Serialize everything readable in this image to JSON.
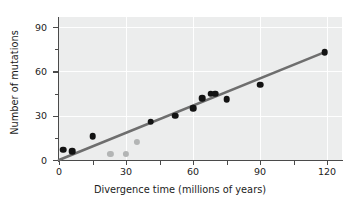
{
  "chart_data": {
    "type": "scatter",
    "title": "",
    "xlabel": "Divergence time (millions of years)",
    "ylabel": "Number of mutations",
    "xlim": [
      0,
      125
    ],
    "ylim": [
      0,
      97
    ],
    "xticks": [
      0,
      30,
      60,
      90,
      120
    ],
    "yticks": [
      0,
      30,
      60,
      90
    ],
    "x_minor_ticks": [
      15,
      45,
      75,
      105
    ],
    "y_minor_ticks": [
      15,
      45,
      75
    ],
    "grid": true,
    "grid_color": "#ffffff",
    "panel_background": "#eceded",
    "legend": null,
    "series": [
      {
        "name": "primate comparisons",
        "marker": "filled-circle",
        "color": "#131313",
        "points": [
          {
            "x": 2,
            "y": 7
          },
          {
            "x": 6,
            "y": 6
          },
          {
            "x": 15,
            "y": 16
          },
          {
            "x": 41,
            "y": 26
          },
          {
            "x": 52,
            "y": 30
          },
          {
            "x": 60,
            "y": 35
          },
          {
            "x": 64,
            "y": 42
          },
          {
            "x": 68,
            "y": 45
          },
          {
            "x": 70,
            "y": 45
          },
          {
            "x": 75,
            "y": 41
          },
          {
            "x": 90,
            "y": 51
          },
          {
            "x": 119,
            "y": 73
          }
        ]
      },
      {
        "name": "outlier comparisons",
        "marker": "filled-circle",
        "color": "#b3b5b5",
        "points": [
          {
            "x": 23,
            "y": 4
          },
          {
            "x": 30,
            "y": 4
          },
          {
            "x": 35,
            "y": 12
          }
        ]
      }
    ],
    "trendline": {
      "name": "regression line",
      "color": "#6e6e6e",
      "width": 2.6,
      "x_start": 0,
      "y_start": 0,
      "x_end": 119,
      "y_end": 73,
      "slope": 0.613,
      "intercept": 0
    }
  },
  "axis": {
    "y_tick_labels": [
      "90",
      "60",
      "30",
      "0"
    ],
    "x_tick_labels": [
      "0",
      "30",
      "60",
      "90",
      "120"
    ],
    "x_title": "Divergence time (millions of years)",
    "y_title": "Number of mutations"
  }
}
